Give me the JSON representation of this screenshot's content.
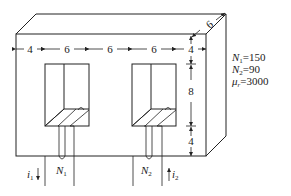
{
  "diagram": {
    "type": "magnetic-core-with-two-windings",
    "dimensions": {
      "top_row": [
        "4",
        "6",
        "6",
        "6",
        "4"
      ],
      "depth": "6",
      "right_column": [
        "4",
        "8",
        "4"
      ]
    },
    "parameters": {
      "n1": {
        "symbol": "N",
        "sub": "1",
        "eq": "=150"
      },
      "n2": {
        "symbol": "N",
        "sub": "2",
        "eq": "=90"
      },
      "mu": {
        "symbol": "μ",
        "sub": "r",
        "eq": "=3000"
      }
    },
    "windings": {
      "w1": {
        "symbol": "N",
        "sub": "1"
      },
      "w2": {
        "symbol": "N",
        "sub": "2"
      }
    },
    "currents": {
      "i1": {
        "symbol": "i",
        "sub": "1",
        "direction": "down"
      },
      "i2": {
        "symbol": "i",
        "sub": "2",
        "direction": "up"
      }
    }
  }
}
